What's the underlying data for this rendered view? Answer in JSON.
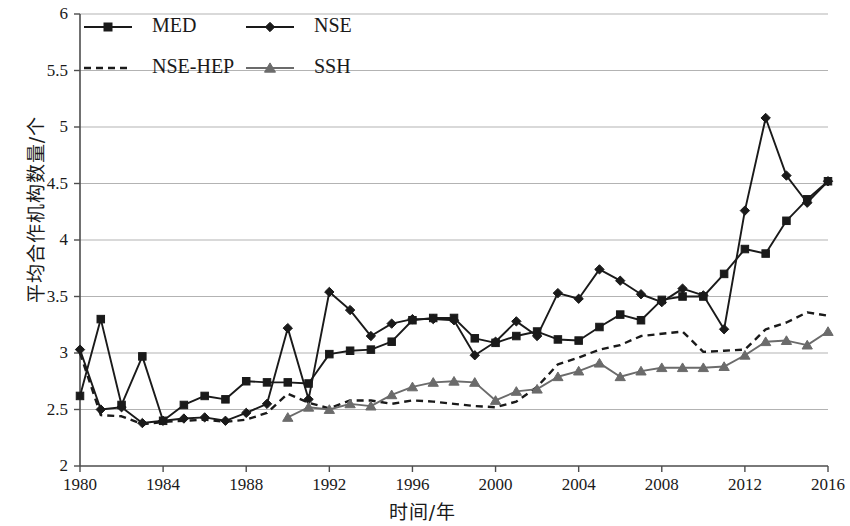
{
  "chart_data": {
    "type": "line",
    "title": "",
    "xlabel": "时间/年",
    "ylabel": "平均合作机构数量/个",
    "xlim": [
      1980,
      2016
    ],
    "ylim": [
      2,
      6
    ],
    "ytick_values": [
      2,
      2.5,
      3,
      3.5,
      4,
      4.5,
      5,
      5.5,
      6
    ],
    "ytick_labels": [
      "2",
      "2.5",
      "3",
      "3.5",
      "4",
      "4.5",
      "5",
      "5.5",
      "6"
    ],
    "xtick_values": [
      1980,
      1984,
      1988,
      1992,
      1996,
      2000,
      2004,
      2008,
      2012,
      2016
    ],
    "xtick_labels": [
      "1980",
      "1984",
      "1988",
      "1992",
      "1996",
      "2000",
      "2004",
      "2008",
      "2012",
      "2016"
    ],
    "grid": "horizontal",
    "legend_position": "top-left",
    "x": [
      1980,
      1981,
      1982,
      1983,
      1984,
      1985,
      1986,
      1987,
      1988,
      1989,
      1990,
      1991,
      1992,
      1993,
      1994,
      1995,
      1996,
      1997,
      1998,
      1999,
      2000,
      2001,
      2002,
      2003,
      2004,
      2005,
      2006,
      2007,
      2008,
      2009,
      2010,
      2011,
      2012,
      2013,
      2014,
      2015,
      2016
    ],
    "series": [
      {
        "name": "MED",
        "color": "#1a1a1a",
        "marker": "square",
        "dash": "solid",
        "values": [
          2.62,
          3.3,
          2.54,
          2.97,
          2.4,
          2.54,
          2.62,
          2.59,
          2.75,
          2.74,
          2.74,
          2.73,
          2.99,
          3.02,
          3.03,
          3.1,
          3.29,
          3.31,
          3.31,
          3.13,
          3.09,
          3.15,
          3.19,
          3.12,
          3.11,
          3.23,
          3.34,
          3.29,
          3.47,
          3.5,
          3.5,
          3.7,
          3.92,
          3.88,
          4.17,
          4.36,
          4.52
        ]
      },
      {
        "name": "NSE",
        "color": "#1a1a1a",
        "marker": "diamond",
        "dash": "solid",
        "values": [
          3.03,
          2.5,
          2.52,
          2.38,
          2.4,
          2.42,
          2.43,
          2.4,
          2.47,
          2.55,
          3.22,
          2.59,
          3.54,
          3.38,
          3.15,
          3.26,
          3.3,
          3.3,
          3.29,
          2.98,
          3.1,
          3.28,
          3.15,
          3.53,
          3.48,
          3.74,
          3.64,
          3.52,
          3.45,
          3.57,
          3.51,
          3.21,
          4.26,
          5.08,
          4.57,
          4.33,
          4.52
        ]
      },
      {
        "name": "NSE-HEP",
        "color": "#1a1a1a",
        "marker": "none",
        "dash": "dashed",
        "values": [
          3.0,
          2.45,
          2.44,
          2.37,
          2.39,
          2.4,
          2.41,
          2.39,
          2.41,
          2.47,
          2.64,
          2.56,
          2.51,
          2.58,
          2.58,
          2.55,
          2.58,
          2.57,
          2.55,
          2.53,
          2.52,
          2.57,
          2.7,
          2.9,
          2.96,
          3.03,
          3.07,
          3.15,
          3.17,
          3.19,
          3.01,
          3.02,
          3.03,
          3.21,
          3.27,
          3.36,
          3.33
        ]
      },
      {
        "name": "SSH",
        "color": "#6b6b6b",
        "marker": "triangle",
        "dash": "solid",
        "values": [
          null,
          null,
          null,
          null,
          null,
          null,
          null,
          null,
          null,
          null,
          2.43,
          2.52,
          2.5,
          2.55,
          2.53,
          2.63,
          2.7,
          2.74,
          2.75,
          2.74,
          2.58,
          2.66,
          2.68,
          2.79,
          2.84,
          2.91,
          2.79,
          2.84,
          2.87,
          2.87,
          2.87,
          2.88,
          2.98,
          3.1,
          3.11,
          3.07,
          3.19
        ]
      }
    ]
  },
  "legend": {
    "items": [
      {
        "label": "MED"
      },
      {
        "label": "NSE"
      },
      {
        "label": "NSE-HEP"
      },
      {
        "label": "SSH"
      }
    ]
  },
  "colors": {
    "axis": "#4d4d4d",
    "grid": "#b3b3b3",
    "dark_series": "#1a1a1a",
    "gray_series": "#6b6b6b",
    "background": "#ffffff"
  }
}
